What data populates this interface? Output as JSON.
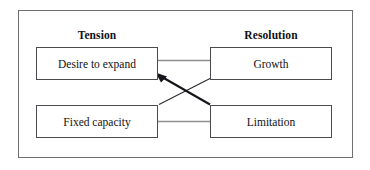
{
  "diagram": {
    "title_visible": false,
    "columns": [
      {
        "label": "Tension"
      },
      {
        "label": "Resolution"
      }
    ],
    "nodes": [
      {
        "id": "desire",
        "label": "Desire to expand",
        "column": "Tension",
        "row": "top"
      },
      {
        "id": "growth",
        "label": "Growth",
        "column": "Resolution",
        "row": "top"
      },
      {
        "id": "capacity",
        "label": "Fixed capacity",
        "column": "Tension",
        "row": "bottom"
      },
      {
        "id": "limitation",
        "label": "Limitation",
        "column": "Resolution",
        "row": "bottom"
      }
    ],
    "links": [
      {
        "from": "desire",
        "to": "growth",
        "style": "straight",
        "arrow": "none"
      },
      {
        "from": "capacity",
        "to": "limitation",
        "style": "straight",
        "arrow": "none"
      },
      {
        "from": "growth",
        "to": "desire",
        "style": "diagonal-thick",
        "arrow": "end"
      },
      {
        "from": "capacity",
        "to": "limitation",
        "style": "diagonal-thin",
        "arrow": "none"
      }
    ],
    "colors": {
      "frame_border": "#6f6f72",
      "node_border": "#4a4a4f",
      "node_fill": "#ffffff",
      "text": "#111114",
      "connector_light": "#8e8e93",
      "connector_dark": "#16161a",
      "background": "#ffffff"
    }
  }
}
